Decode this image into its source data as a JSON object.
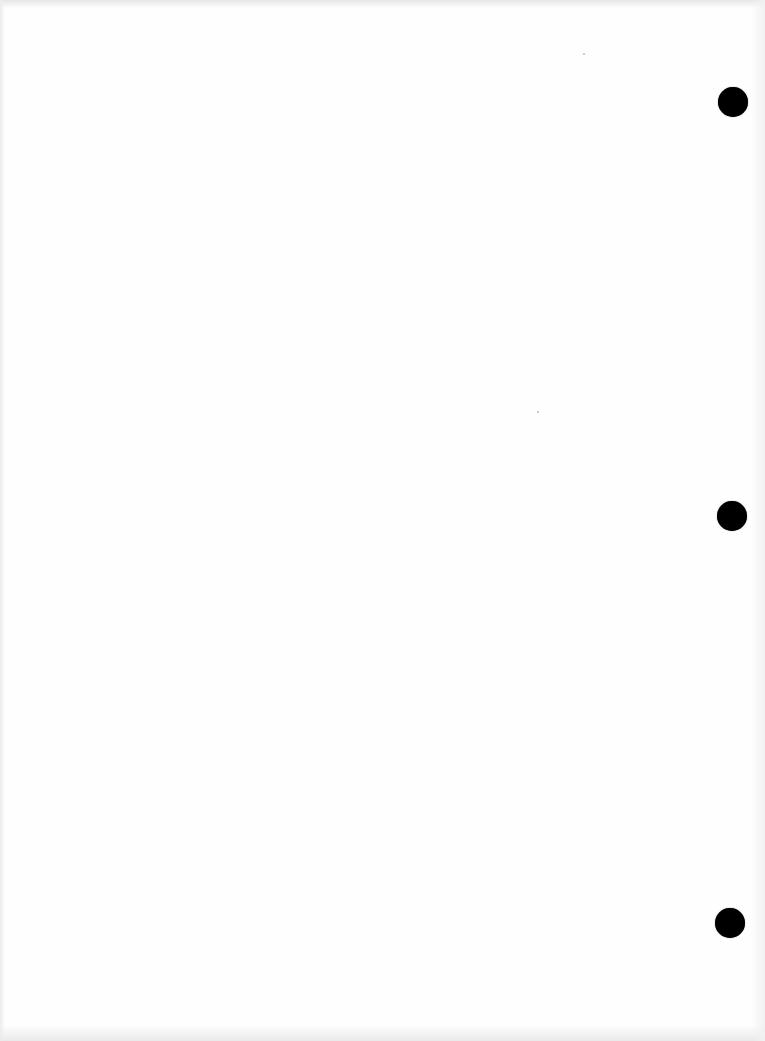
{
  "document": {
    "type": "blank scanned page",
    "text": "",
    "punch_holes": [
      {
        "cx": 733,
        "cy": 102,
        "r": 15
      },
      {
        "cx": 732,
        "cy": 516,
        "r": 15
      },
      {
        "cx": 730,
        "cy": 923,
        "r": 15
      }
    ]
  },
  "colors": {
    "paper": "#fefefe",
    "hole": "#000000"
  }
}
